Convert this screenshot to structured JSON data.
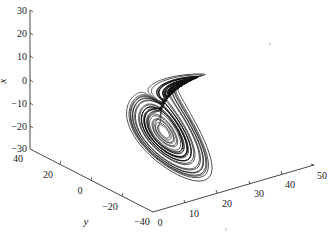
{
  "chart_data": {
    "type": "line3d",
    "title": "",
    "axes": {
      "x": {
        "label": "x",
        "ticks": [
          30,
          20,
          10,
          0,
          -10,
          -20,
          -30
        ],
        "range": [
          -30,
          30
        ],
        "tick_labels": [
          "30",
          "20",
          "10",
          "0",
          "−10",
          "−20",
          "−30"
        ]
      },
      "y": {
        "label": "y",
        "ticks": [
          40,
          20,
          0,
          -20,
          -40
        ],
        "range": [
          -40,
          40
        ],
        "tick_labels": [
          "40",
          "20",
          "0",
          "−20",
          "−40"
        ]
      },
      "z": {
        "label": "τ",
        "ticks": [
          0,
          10,
          20,
          30,
          40,
          50
        ],
        "range": [
          0,
          50
        ],
        "tick_labels": [
          "0",
          "10",
          "20",
          "30",
          "40",
          "50"
        ]
      }
    },
    "grid": false,
    "legend": null,
    "series": [
      {
        "name": "trajectory",
        "color": "#111111"
      }
    ],
    "annotations": [
      {
        "text": "τ",
        "position": "upper-right, faint"
      }
    ]
  },
  "axis_labels": {
    "x": "x",
    "y": "y",
    "z": "τ"
  },
  "faint_label": "τ",
  "x_ticks": [
    "30",
    "20",
    "10",
    "0",
    "−10",
    "−20",
    "−30"
  ],
  "y_ticks": [
    "40",
    "20",
    "0",
    "−20",
    "−40"
  ],
  "z_ticks": [
    "0",
    "10",
    "20",
    "30",
    "40",
    "50"
  ]
}
